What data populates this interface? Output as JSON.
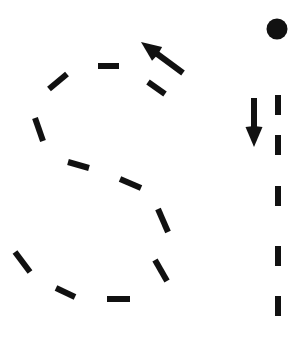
{
  "figure": {
    "width": 304,
    "height": 340,
    "background_color": "#ffffff",
    "stroke_color": "#111111"
  },
  "chart_data": {
    "type": "scatter",
    "xlabel": "",
    "ylabel": "",
    "grid": false,
    "legend": null,
    "xlim": [
      0,
      304
    ],
    "ylim": [
      0,
      340
    ],
    "series": [
      {
        "name": "s-curve-dashes",
        "values": [
          {
            "x1": 98,
            "y1": 66,
            "x2": 119,
            "y2": 66
          },
          {
            "x1": 49,
            "y1": 89,
            "x2": 67,
            "y2": 74
          },
          {
            "x1": 35,
            "y1": 118,
            "x2": 43,
            "y2": 141
          },
          {
            "x1": 68,
            "y1": 162,
            "x2": 89,
            "y2": 168
          },
          {
            "x1": 120,
            "y1": 179,
            "x2": 141,
            "y2": 188
          },
          {
            "x1": 158,
            "y1": 209,
            "x2": 168,
            "y2": 232
          },
          {
            "x1": 155,
            "y1": 260,
            "x2": 167,
            "y2": 281
          },
          {
            "x1": 107,
            "y1": 299,
            "x2": 130,
            "y2": 299
          },
          {
            "x1": 56,
            "y1": 288,
            "x2": 75,
            "y2": 297
          },
          {
            "x1": 15,
            "y1": 252,
            "x2": 30,
            "y2": 272
          },
          {
            "x1": 148,
            "y1": 82,
            "x2": 165,
            "y2": 94
          }
        ]
      },
      {
        "name": "vertical-dashes",
        "values": [
          {
            "x1": 278,
            "y1": 95,
            "x2": 278,
            "y2": 115
          },
          {
            "x1": 278,
            "y1": 135,
            "x2": 278,
            "y2": 155
          },
          {
            "x1": 278,
            "y1": 186,
            "x2": 278,
            "y2": 206
          },
          {
            "x1": 278,
            "y1": 246,
            "x2": 278,
            "y2": 266
          },
          {
            "x1": 278,
            "y1": 296,
            "x2": 278,
            "y2": 316
          }
        ]
      }
    ],
    "markers": [
      {
        "name": "filled-dot",
        "shape": "circle",
        "x": 277,
        "y": 29,
        "radius": 10.5,
        "fill": "#111111"
      }
    ],
    "annotations": [
      {
        "name": "up-left-arrow",
        "type": "arrow",
        "from": {
          "x": 183,
          "y": 73
        },
        "to": {
          "x": 141,
          "y": 42
        }
      },
      {
        "name": "down-arrow",
        "type": "arrow",
        "from": {
          "x": 254,
          "y": 98
        },
        "to": {
          "x": 254,
          "y": 147
        }
      }
    ]
  }
}
